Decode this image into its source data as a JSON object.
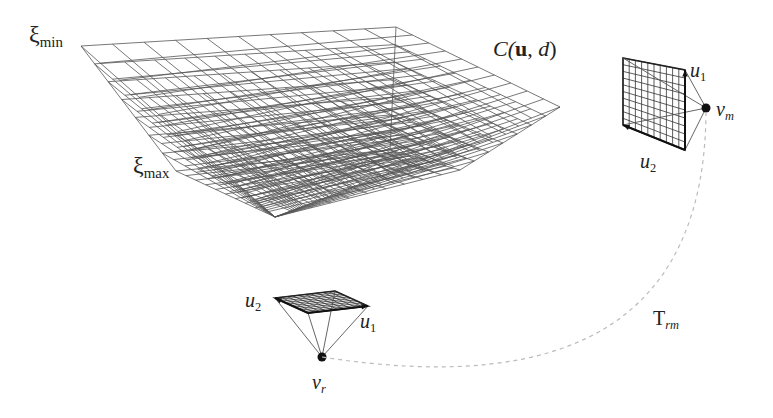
{
  "figure": {
    "type": "cost-volume-diagram",
    "labels": {
      "xi_min": {
        "symbol": "ξ",
        "sub": "min"
      },
      "xi_max": {
        "symbol": "ξ",
        "sub": "max"
      },
      "cost_volume": {
        "prefix": "C(",
        "u": "u",
        "mid": ", ",
        "d": "d",
        "suffix": ")"
      },
      "matching_camera": {
        "v": "v",
        "sub": "m"
      },
      "reference_camera": {
        "v": "v",
        "sub": "r"
      },
      "transform": {
        "T": "T",
        "sub": "rm"
      },
      "ref_u1": {
        "u": "u",
        "sub": "1"
      },
      "ref_u2": {
        "u": "u",
        "sub": "2"
      },
      "match_u1": {
        "u": "u",
        "sub": "1"
      },
      "match_u2": {
        "u": "u",
        "sub": "2"
      }
    },
    "cost_volume_geometry": {
      "near_plane": [
        [
          81,
          46
        ],
        [
          396,
          27
        ],
        [
          560,
          107
        ],
        [
          275,
          217
        ]
      ],
      "far_plane": [
        [
          176,
          171
        ],
        [
          390,
          150
        ],
        [
          460,
          170
        ],
        [
          275,
          217
        ]
      ],
      "grid_divisions": 10,
      "depth_planes": 8,
      "line_color": "#555555"
    },
    "reference_image_plane": {
      "corners": [
        [
          275,
          298
        ],
        [
          335,
          291
        ],
        [
          368,
          306
        ],
        [
          308,
          313
        ]
      ],
      "camera_center": [
        322,
        357
      ],
      "grid_divisions": 10
    },
    "matching_image_plane": {
      "corners": [
        [
          623,
          58
        ],
        [
          685,
          70
        ],
        [
          685,
          150
        ],
        [
          623,
          125
        ]
      ],
      "camera_center": [
        706,
        108
      ],
      "grid_divisions": 10
    },
    "transform_arc": {
      "from": [
        322,
        357
      ],
      "to": [
        706,
        112
      ],
      "color": "#bbbbbb"
    }
  }
}
